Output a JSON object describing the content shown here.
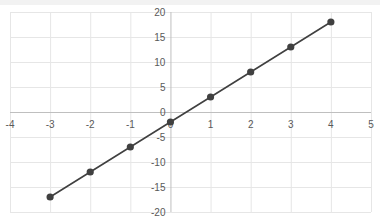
{
  "chart_data": {
    "type": "scatter",
    "mode": "lines+markers",
    "title": "",
    "xlabel": "",
    "ylabel": "",
    "xlim": [
      -4,
      5
    ],
    "ylim": [
      -20,
      20
    ],
    "x_ticks": [
      -4,
      -3,
      -2,
      -1,
      0,
      1,
      2,
      3,
      4,
      5
    ],
    "y_ticks": [
      -20,
      -15,
      -10,
      -5,
      0,
      5,
      10,
      15,
      20
    ],
    "grid": true,
    "legend": null,
    "series": [
      {
        "name": "Series1",
        "x": [
          -3,
          -2,
          -1,
          0,
          1,
          2,
          3,
          4
        ],
        "y": [
          -17,
          -12,
          -7,
          -2,
          3,
          8,
          13,
          18
        ]
      }
    ]
  },
  "colors": {
    "line": "#404040",
    "marker": "#404040",
    "grid": "#e6e6e6",
    "axis": "#bfbfbf",
    "tick_text": "#595959"
  }
}
